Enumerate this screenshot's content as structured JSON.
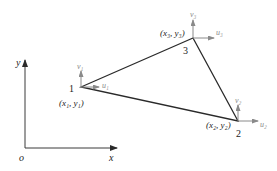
{
  "figure": {
    "type": "triangular-element-diagram",
    "axes": {
      "origin_label": "o",
      "x_label": "x",
      "y_label": "y"
    },
    "nodes": [
      {
        "id": "1",
        "coord_label": "(x₁, y₁)",
        "u_label": "u₁",
        "v_label": "v₁"
      },
      {
        "id": "2",
        "coord_label": "(x₂, y₂)",
        "u_label": "u₂",
        "v_label": "v₂"
      },
      {
        "id": "3",
        "coord_label": "(x₃, y₃)",
        "u_label": "u₃",
        "v_label": "v₃"
      }
    ],
    "colors": {
      "edge": "#2a2a2a",
      "axis": "#3a3a3a",
      "arrow": "#8a8a8a",
      "text": "#222222"
    }
  }
}
